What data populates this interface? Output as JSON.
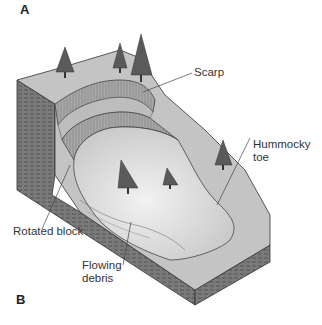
{
  "panels": {
    "a": "A",
    "b": "B"
  },
  "labels": {
    "scarp": "Scarp",
    "hummocky_toe_line1": "Hummocky",
    "hummocky_toe_line2": "toe",
    "rotated_block": "Rotated block",
    "flowing_debris_line1": "Flowing",
    "flowing_debris_line2": "debris"
  },
  "colors": {
    "ground_top": "#c4c4c4",
    "flow_surface": "#e0e0e0",
    "scarp_face": "#9a9a9a",
    "block_side": "#6e6e6e",
    "tree": "#5a5a5a"
  }
}
